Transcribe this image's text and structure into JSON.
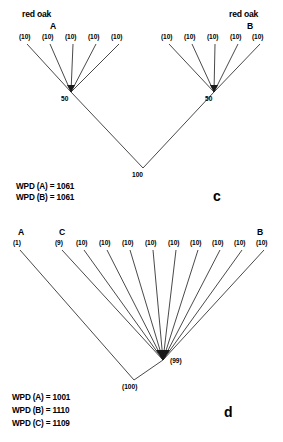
{
  "figure": {
    "width": 283,
    "height": 442,
    "background": "#ffffff",
    "ink_color": "#1a1a1a"
  },
  "panels": [
    {
      "id": "panel-c",
      "letter": "c",
      "letter_pos": {
        "x": 213,
        "y": 189
      },
      "headers": [
        {
          "name": "species-label-left",
          "text": "red oak",
          "x": 22,
          "y": 10
        },
        {
          "name": "species-label-right",
          "text": "red oak",
          "x": 229,
          "y": 10
        }
      ],
      "taxa": [
        {
          "name": "taxon-a",
          "text": "A",
          "x": 50,
          "y": 22
        },
        {
          "name": "taxon-b",
          "text": "B",
          "x": 247,
          "y": 22
        }
      ],
      "leaves": [
        {
          "label": "(10)",
          "lx": 19,
          "ly": 34,
          "tipx": 27,
          "tipy": 44
        },
        {
          "label": "(10)",
          "lx": 42,
          "ly": 34,
          "tipx": 50,
          "tipy": 44
        },
        {
          "label": "(10)",
          "lx": 65,
          "ly": 34,
          "tipx": 73,
          "tipy": 44
        },
        {
          "label": "(10)",
          "lx": 88,
          "ly": 34,
          "tipx": 96,
          "tipy": 44
        },
        {
          "label": "(10)",
          "lx": 111,
          "ly": 34,
          "tipx": 119,
          "tipy": 44
        },
        {
          "label": "(10)",
          "lx": 161,
          "ly": 34,
          "tipx": 169,
          "tipy": 44
        },
        {
          "label": "(10)",
          "lx": 184,
          "ly": 34,
          "tipx": 192,
          "tipy": 44
        },
        {
          "label": "(10)",
          "lx": 207,
          "ly": 34,
          "tipx": 215,
          "tipy": 44
        },
        {
          "label": "(10)",
          "lx": 230,
          "ly": 34,
          "tipx": 238,
          "tipy": 44
        },
        {
          "label": "(10)",
          "lx": 252,
          "ly": 34,
          "tipx": 260,
          "tipy": 44
        }
      ],
      "nodes": [
        {
          "name": "node-left",
          "label": "50",
          "x": 71,
          "y": 92,
          "lx": 61,
          "ly": 96
        },
        {
          "name": "node-right",
          "label": "50",
          "x": 214,
          "y": 92,
          "lx": 205,
          "ly": 96
        },
        {
          "name": "node-root",
          "label": "100",
          "x": 143,
          "y": 168,
          "lx": 132,
          "ly": 172
        }
      ],
      "stats": [
        {
          "name": "wpd-a",
          "text": "WPD (A) = 1061",
          "x": 16,
          "y": 183
        },
        {
          "name": "wpd-b",
          "text": "WPD (B) = 1061",
          "x": 16,
          "y": 194
        }
      ]
    },
    {
      "id": "panel-d",
      "letter": "d",
      "letter_pos": {
        "x": 224,
        "y": 405
      },
      "headers": [],
      "taxa": [
        {
          "name": "taxon-a",
          "text": "A",
          "x": 18,
          "y": 228
        },
        {
          "name": "taxon-c",
          "text": "C",
          "x": 59,
          "y": 228
        },
        {
          "name": "taxon-b",
          "text": "B",
          "x": 257,
          "y": 228
        }
      ],
      "leaves": [
        {
          "label": "(1)",
          "lx": 13,
          "ly": 240,
          "tipx": 20,
          "tipy": 250
        },
        {
          "label": "(9)",
          "lx": 55,
          "ly": 240,
          "tipx": 62,
          "tipy": 250
        },
        {
          "label": "(10)",
          "lx": 76,
          "ly": 240,
          "tipx": 84,
          "tipy": 250
        },
        {
          "label": "(10)",
          "lx": 99,
          "ly": 240,
          "tipx": 107,
          "tipy": 250
        },
        {
          "label": "(10)",
          "lx": 122,
          "ly": 240,
          "tipx": 130,
          "tipy": 250
        },
        {
          "label": "(10)",
          "lx": 145,
          "ly": 240,
          "tipx": 153,
          "tipy": 250
        },
        {
          "label": "(10)",
          "lx": 168,
          "ly": 240,
          "tipx": 176,
          "tipy": 250
        },
        {
          "label": "(10)",
          "lx": 190,
          "ly": 240,
          "tipx": 198,
          "tipy": 250
        },
        {
          "label": "(10)",
          "lx": 212,
          "ly": 240,
          "tipx": 220,
          "tipy": 250
        },
        {
          "label": "(10)",
          "lx": 234,
          "ly": 240,
          "tipx": 242,
          "tipy": 250
        },
        {
          "label": "(10)",
          "lx": 256,
          "ly": 240,
          "tipx": 264,
          "tipy": 250
        }
      ],
      "nodes": [
        {
          "name": "node-internal",
          "label": "(99)",
          "x": 163,
          "y": 360,
          "lx": 170,
          "ly": 358
        },
        {
          "name": "node-root",
          "label": "(100)",
          "x": 134,
          "y": 380,
          "lx": 122,
          "ly": 384
        }
      ],
      "stats": [
        {
          "name": "wpd-a",
          "text": "WPD (A) = 1001",
          "x": 12,
          "y": 394
        },
        {
          "name": "wpd-b",
          "text": "WPD (B) = 1110",
          "x": 12,
          "y": 407
        },
        {
          "name": "wpd-c",
          "text": "WPD (C) = 1109",
          "x": 12,
          "y": 420
        }
      ]
    }
  ]
}
